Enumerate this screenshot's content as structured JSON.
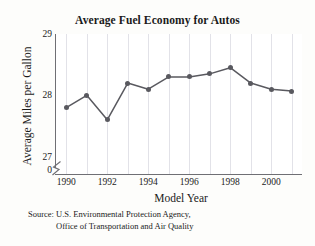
{
  "chart_data": {
    "type": "line",
    "title": "Average Fuel Economy for Autos",
    "xlabel": "Model Year",
    "ylabel": "Average Miles per Gallon",
    "x": [
      1990,
      1991,
      1992,
      1993,
      1994,
      1995,
      1996,
      1997,
      1998,
      1999,
      2000,
      2001
    ],
    "values": [
      27.8,
      28.0,
      27.6,
      28.2,
      28.1,
      28.3,
      28.3,
      28.35,
      28.45,
      28.2,
      28.1,
      28.07
    ],
    "xlim": [
      1989.5,
      2001.5
    ],
    "ylim": [
      26.7,
      29.0
    ],
    "xticks": [
      1990,
      1992,
      1994,
      1996,
      1998,
      2000
    ],
    "xtick_labels": [
      "1990",
      "1992",
      "1994",
      "1996",
      "1998",
      "2000"
    ],
    "yticks": [
      27,
      28,
      29
    ],
    "ytick_labels": [
      "27",
      "28",
      "29"
    ],
    "y_axis_origin_label": "0",
    "axis_break": true,
    "grid": "vertical",
    "legend": null,
    "line_color": "#59595f",
    "grid_color": "#e2e2e8",
    "axis_color": "#6f6f74"
  },
  "source": {
    "line1": "Source: U.S. Environmental Protection Agency,",
    "line2": "Office of Transportation and Air Quality"
  }
}
